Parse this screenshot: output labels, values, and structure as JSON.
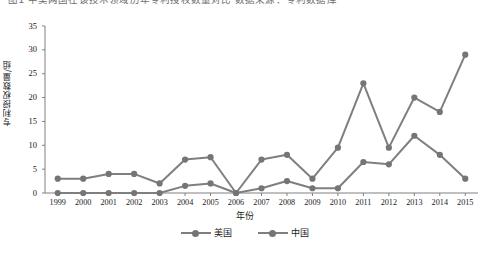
{
  "caption": {
    "text": "图1 中美两国在该技术领域历年专利授权数量对比 数据来源：专利数据库"
  },
  "axes": {
    "ylabel": "专利授权数量/组",
    "xlabel": "年份",
    "yticks": [
      "0",
      "5",
      "10",
      "15",
      "20",
      "25",
      "30",
      "35"
    ],
    "xticks": [
      "1999",
      "2000",
      "2001",
      "2002",
      "2003",
      "2004",
      "2005",
      "2006",
      "2007",
      "2008",
      "2009",
      "2010",
      "2011",
      "2012",
      "2013",
      "2014",
      "2015"
    ]
  },
  "legend": {
    "items": [
      {
        "label": "美国",
        "color": "#7f7f7f"
      },
      {
        "label": "中国",
        "color": "#7f7f7f"
      }
    ]
  },
  "colors": {
    "series_us": "#7f7f7f",
    "series_cn": "#7f7f7f",
    "axis": "#808080",
    "marker": "#757575"
  },
  "chart_data": {
    "type": "line",
    "title": "",
    "xlabel": "年份",
    "ylabel": "专利授权数量/组",
    "categories": [
      "1999",
      "2000",
      "2001",
      "2002",
      "2003",
      "2004",
      "2005",
      "2006",
      "2007",
      "2008",
      "2009",
      "2010",
      "2011",
      "2012",
      "2013",
      "2014",
      "2015"
    ],
    "ylim": [
      0,
      35
    ],
    "yticks": [
      0,
      5,
      10,
      15,
      20,
      25,
      30,
      35
    ],
    "grid": false,
    "legend_position": "bottom-center",
    "series": [
      {
        "name": "美国",
        "color": "#7f7f7f",
        "values": [
          3,
          3,
          4,
          4,
          2,
          7,
          7.5,
          0,
          7,
          8,
          3,
          9.5,
          23,
          9.5,
          20,
          17,
          29
        ]
      },
      {
        "name": "中国",
        "color": "#7f7f7f",
        "values": [
          0,
          0,
          0,
          0,
          0,
          1.5,
          2,
          0,
          1,
          2.5,
          1,
          1,
          6.5,
          6,
          12,
          8,
          3
        ]
      }
    ]
  }
}
